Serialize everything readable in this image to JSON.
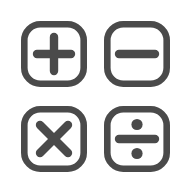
{
  "canvas": {
    "width": 190,
    "height": 174,
    "background_color": "#ffffff",
    "title": "Arithmetic Operator Buttons",
    "layout": "2x2 grid of rounded-square outline icon buttons"
  },
  "style": {
    "stroke_color": "#4a4a4a",
    "fill_color": "#ffffff",
    "frame_stroke_width": 6.6,
    "glyph_stroke_width": 8.4,
    "corner_radius": 16
  },
  "buttons": [
    {
      "id": "plus",
      "icon_name": "plus-icon",
      "label": "+",
      "operation": "Add",
      "row": 1,
      "column": 1,
      "x": 21,
      "y": 21,
      "width": 66,
      "height": 66
    },
    {
      "id": "minus",
      "icon_name": "minus-icon",
      "label": "−",
      "operation": "Subtract",
      "row": 1,
      "column": 2,
      "x": 104,
      "y": 21,
      "width": 66,
      "height": 66
    },
    {
      "id": "multiply",
      "icon_name": "multiply-icon",
      "label": "×",
      "operation": "Multiply",
      "row": 2,
      "column": 1,
      "x": 21,
      "y": 106,
      "width": 66,
      "height": 66
    },
    {
      "id": "divide",
      "icon_name": "divide-icon",
      "label": "÷",
      "operation": "Divide",
      "row": 2,
      "column": 2,
      "x": 104,
      "y": 106,
      "width": 66,
      "height": 66
    }
  ]
}
